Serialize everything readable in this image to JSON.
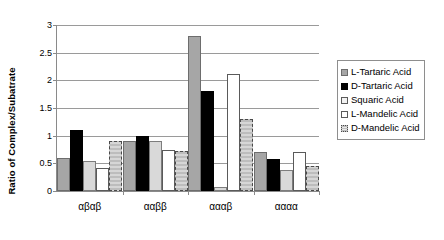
{
  "chart_data": {
    "type": "bar",
    "title": "",
    "xlabel": "",
    "ylabel": "Ratio of Complex/Subatrate",
    "ylim": [
      0,
      3
    ],
    "yticks": [
      "0",
      "0.5",
      "1",
      "1.5",
      "2",
      "2.5",
      "3"
    ],
    "ytick_values": [
      0,
      0.5,
      1,
      1.5,
      2,
      2.5,
      3
    ],
    "grid": "horizontal",
    "legend_position": "right",
    "categories": [
      "αβαβ",
      "ααββ",
      "αααβ",
      "αααα"
    ],
    "series": [
      {
        "name": "L-Tartaric Acid",
        "swatch": "gray-fill",
        "color": "#a6a6a6",
        "values": [
          0.6,
          0.9,
          2.8,
          0.7
        ]
      },
      {
        "name": "D-Tartaric Acid",
        "swatch": "black-fill",
        "color": "#000000",
        "values": [
          1.1,
          1.0,
          1.8,
          0.58
        ]
      },
      {
        "name": "Squaric Acid",
        "swatch": "light-gray-fill",
        "color": "#d9d9d9",
        "values": [
          0.55,
          0.9,
          0.08,
          0.38
        ]
      },
      {
        "name": "L-Mandelic Acid",
        "swatch": "white-fill",
        "color": "#ffffff",
        "values": [
          0.42,
          0.75,
          2.12,
          0.7
        ]
      },
      {
        "name": "D-Mandelic Acid",
        "swatch": "hatched-fill",
        "color": "#c9c9c9",
        "values": [
          0.9,
          0.72,
          1.3,
          0.45
        ]
      }
    ]
  }
}
